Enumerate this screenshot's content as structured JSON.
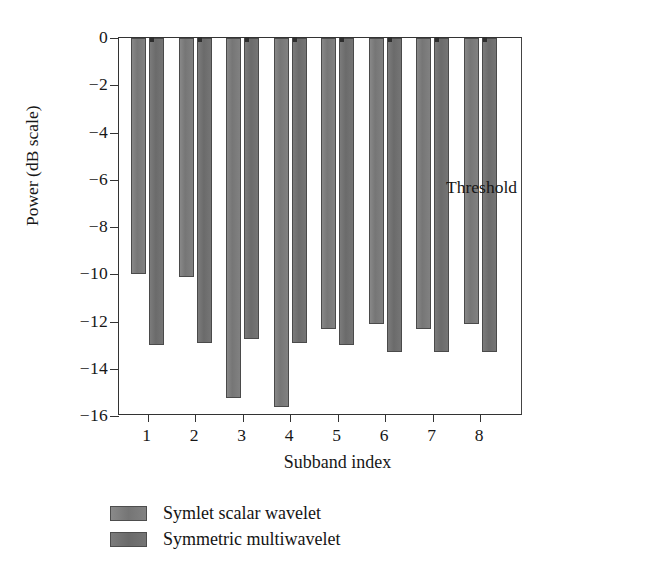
{
  "chart_data": {
    "type": "bar",
    "title": "",
    "subtitle": "",
    "xlabel": "Subband index",
    "ylabel": "Power (dB scale)",
    "categories": [
      "1",
      "2",
      "3",
      "4",
      "5",
      "6",
      "7",
      "8"
    ],
    "series": [
      {
        "name": "Symlet scalar wavelet",
        "color": "#7d7d7d",
        "values": [
          -10.0,
          -10.1,
          -15.25,
          -15.6,
          -12.3,
          -12.1,
          -12.3,
          -12.1
        ]
      },
      {
        "name": "Symmetric multiwavelet",
        "color": "#6e6e6e",
        "values": [
          -13.0,
          -12.9,
          -12.75,
          -12.9,
          -13.0,
          -13.3,
          -13.3,
          -13.3
        ]
      }
    ],
    "ylim": [
      -16,
      0
    ],
    "yticks": [
      0,
      -2,
      -4,
      -6,
      -8,
      -10,
      -12,
      -14,
      -16
    ],
    "ytick_labels": [
      "0",
      "−2",
      "−4",
      "−6",
      "−8",
      "−10",
      "−12",
      "−14",
      "−16"
    ],
    "xlim": [
      0.4,
      8.9
    ],
    "grid": false,
    "legend_position": "below-left",
    "annotations": [
      {
        "name": "threshold",
        "label": "Threshold",
        "value": -7.0,
        "style": "dash-dot",
        "color": "#2b2b2b"
      }
    ]
  },
  "axes": {
    "y_title": "Power (dB scale)",
    "x_title": "Subband index"
  },
  "legend": {
    "items": [
      {
        "label": "Symlet scalar wavelet",
        "color": "#7d7d7d"
      },
      {
        "label": "Symmetric multiwavelet",
        "color": "#6e6e6e"
      }
    ]
  },
  "threshold": {
    "label": "Threshold",
    "value": "-7.0"
  }
}
